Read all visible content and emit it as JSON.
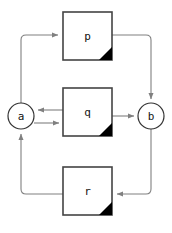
{
  "diagram": {
    "type": "block-flow-diagram",
    "canvas": {
      "width": 172,
      "height": 233,
      "background": "#ffffff"
    },
    "style": {
      "box_border_color": "#444444",
      "box_fill_color": "#ffffff",
      "box_corner_fold_color": "#000000",
      "circle_border_color": "#333333",
      "circle_fill_color": "#ffffff",
      "edge_color": "#808080",
      "label_color": "#111111"
    },
    "nodes": [
      {
        "id": "p",
        "label": "p",
        "shape": "box-folded-corner",
        "x": 63,
        "y": 12,
        "width": 49,
        "height": 48
      },
      {
        "id": "q",
        "label": "q",
        "shape": "box-folded-corner",
        "x": 63,
        "y": 88,
        "width": 49,
        "height": 48
      },
      {
        "id": "r",
        "label": "r",
        "shape": "box-folded-corner",
        "x": 63,
        "y": 167,
        "width": 49,
        "height": 48
      },
      {
        "id": "a",
        "label": "a",
        "shape": "circle",
        "cx": 21,
        "cy": 116,
        "r": 13
      },
      {
        "id": "b",
        "label": "b",
        "shape": "circle",
        "cx": 151,
        "cy": 116,
        "r": 13
      }
    ],
    "edges": [
      {
        "id": "a-to-p",
        "from": "a",
        "to": "p",
        "arrow_at": "p",
        "direction": "up-then-right"
      },
      {
        "id": "p-to-b",
        "from": "p",
        "to": "b",
        "arrow_at": "b",
        "direction": "right-then-down"
      },
      {
        "id": "q-to-a",
        "from": "q",
        "to": "a",
        "arrow_at": "a",
        "direction": "left"
      },
      {
        "id": "a-to-q",
        "from": "a",
        "to": "q",
        "arrow_at": "q",
        "direction": "right"
      },
      {
        "id": "q-to-b",
        "from": "q",
        "to": "b",
        "arrow_at": "b",
        "direction": "right"
      },
      {
        "id": "b-to-r",
        "from": "b",
        "to": "r",
        "arrow_at": "r",
        "direction": "down-then-left"
      },
      {
        "id": "r-to-a",
        "from": "r",
        "to": "a",
        "arrow_at": "a",
        "direction": "left-then-up"
      }
    ]
  }
}
